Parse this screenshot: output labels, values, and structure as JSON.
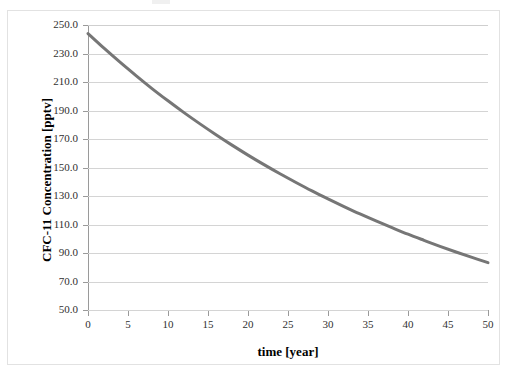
{
  "chart_data": {
    "type": "line",
    "title": "",
    "xlabel": "time [year]",
    "ylabel": "CFC-11 Concentration [pptv]",
    "xlim": [
      0,
      50
    ],
    "ylim": [
      50.0,
      250.0
    ],
    "xticks": [
      0,
      5,
      10,
      15,
      20,
      25,
      30,
      35,
      40,
      45,
      50
    ],
    "xtick_labels": [
      "0",
      "5",
      "10",
      "15",
      "20",
      "25",
      "30",
      "35",
      "40",
      "45",
      "50"
    ],
    "yticks": [
      50.0,
      70.0,
      90.0,
      110.0,
      130.0,
      150.0,
      170.0,
      190.0,
      210.0,
      230.0,
      250.0
    ],
    "ytick_labels": [
      "50.0",
      "70.0",
      "90.0",
      "110.0",
      "130.0",
      "150.0",
      "170.0",
      "190.0",
      "210.0",
      "230.0",
      "250.0"
    ],
    "grid": "horizontal",
    "legend": "none",
    "series": [
      {
        "name": "CFC-11 concentration",
        "color": "#767676",
        "line_width": 3,
        "x": [
          0,
          2,
          4,
          6,
          8,
          10,
          12,
          14,
          16,
          18,
          20,
          22,
          24,
          26,
          28,
          30,
          32,
          34,
          36,
          38,
          40,
          42,
          44,
          46,
          48,
          50
        ],
        "values": [
          244.0,
          233.7,
          223.9,
          214.5,
          205.4,
          196.8,
          188.5,
          180.6,
          173.0,
          165.7,
          158.7,
          152.0,
          145.6,
          139.5,
          133.6,
          128.0,
          122.6,
          117.4,
          112.5,
          107.8,
          103.2,
          98.9,
          94.7,
          90.7,
          86.9,
          83.2
        ]
      }
    ],
    "annotations": []
  },
  "figure": {
    "x_axis_title": "time [year]",
    "y_axis_title": "CFC-11 Concentration [pptv]",
    "grid_color": "#d4d4d4",
    "axis_color": "#9a9a9a",
    "border_color": "#e2e2e2",
    "background": "#ffffff",
    "curve_color": "#767676"
  }
}
